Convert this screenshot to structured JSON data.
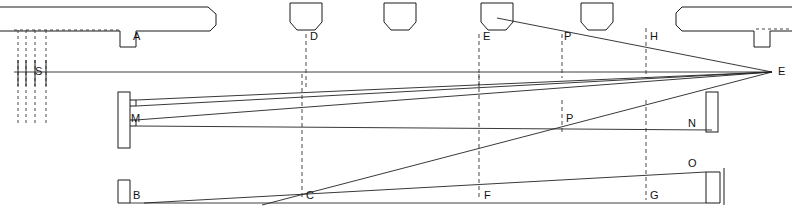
{
  "diagram": {
    "canvas": {
      "width": 792,
      "height": 210
    },
    "colors": {
      "line": "#1a1a1a",
      "ray": "#222222",
      "dashed": "#333333",
      "background": "#ffffff"
    },
    "labels": [
      {
        "key": "A",
        "text": "A",
        "x": 133,
        "y": 31,
        "role": "upper-left-baffle"
      },
      {
        "key": "S",
        "text": "S",
        "x": 35,
        "y": 66,
        "role": "source-slit"
      },
      {
        "key": "D",
        "text": "D",
        "x": 310,
        "y": 31,
        "role": "upper-stop-d"
      },
      {
        "key": "E_top",
        "text": "E",
        "x": 483,
        "y": 31,
        "role": "upper-stop-e"
      },
      {
        "key": "P_top",
        "text": "P",
        "x": 564,
        "y": 31,
        "role": "upper-point-p"
      },
      {
        "key": "H",
        "text": "H",
        "x": 650,
        "y": 31,
        "role": "upper-station-h"
      },
      {
        "key": "E_right",
        "text": "E",
        "x": 778,
        "y": 66,
        "role": "convergence-point-e"
      },
      {
        "key": "M",
        "text": "M",
        "x": 131,
        "y": 118,
        "role": "mirror-slit-m"
      },
      {
        "key": "P_mid",
        "text": "P",
        "x": 566,
        "y": 118,
        "role": "mid-point-p"
      },
      {
        "key": "N",
        "text": "N",
        "x": 690,
        "y": 125,
        "role": "right-stop-n"
      },
      {
        "key": "O",
        "text": "O",
        "x": 690,
        "y": 163,
        "role": "right-corner-o"
      },
      {
        "key": "B",
        "text": "B",
        "x": 133,
        "y": 196,
        "role": "lower-left-baffle"
      },
      {
        "key": "C",
        "text": "C",
        "x": 306,
        "y": 196,
        "role": "lower-station-c"
      },
      {
        "key": "F",
        "text": "F",
        "x": 484,
        "y": 196,
        "role": "lower-station-f"
      },
      {
        "key": "G",
        "text": "G",
        "x": 650,
        "y": 196,
        "role": "lower-station-g"
      }
    ],
    "axis": {
      "name": "optical-axis",
      "from": [
        14,
        72
      ],
      "to": [
        772,
        72
      ]
    },
    "convergence_point": [
      772,
      72
    ],
    "vertical_stations": [
      {
        "name": "station-d",
        "x": 306,
        "y1": 34,
        "y2": 88
      },
      {
        "name": "station-e",
        "x": 479,
        "y1": 34,
        "y2": 90
      },
      {
        "name": "station-p",
        "x": 562,
        "y1": 34,
        "y2": 78
      },
      {
        "name": "station-h",
        "x": 646,
        "y1": 28,
        "y2": 78
      },
      {
        "name": "station-c",
        "x": 302,
        "y1": 74,
        "y2": 200
      },
      {
        "name": "station-f",
        "x": 479,
        "y1": 74,
        "y2": 200
      },
      {
        "name": "station-g",
        "x": 646,
        "y1": 100,
        "y2": 200
      },
      {
        "name": "station-p-mid",
        "x": 562,
        "y1": 100,
        "y2": 130
      }
    ],
    "source_lines": {
      "count": 4,
      "x_positions": [
        18,
        26,
        35,
        46
      ],
      "top": 30,
      "bottom": 126,
      "solid_top": 60,
      "solid_bottom": 86
    },
    "trapezoid_stops": [
      {
        "name": "stop-d",
        "cx": 306,
        "top": 3,
        "bottom": 30,
        "top_half_width": 16,
        "bottom_half_width": 13
      },
      {
        "name": "stop-unlabeled",
        "cx": 400,
        "top": 3,
        "bottom": 30,
        "top_half_width": 16,
        "bottom_half_width": 13
      },
      {
        "name": "stop-e",
        "cx": 497,
        "top": 3,
        "bottom": 30,
        "top_half_width": 16,
        "bottom_half_width": 13
      },
      {
        "name": "stop-p",
        "cx": 597,
        "top": 3,
        "bottom": 30,
        "top_half_width": 16,
        "bottom_half_width": 13
      }
    ],
    "rays": [
      {
        "name": "ray-m-to-e-upper",
        "from": [
          128,
          98
        ],
        "to": [
          772,
          72
        ]
      },
      {
        "name": "ray-m-to-e-mid",
        "from": [
          128,
          106
        ],
        "to": [
          772,
          72
        ]
      },
      {
        "name": "ray-m-to-e-lower",
        "from": [
          128,
          120
        ],
        "to": [
          772,
          72
        ]
      },
      {
        "name": "ray-m-to-n",
        "from": [
          128,
          126
        ],
        "to": [
          712,
          130
        ]
      },
      {
        "name": "ray-top-to-e",
        "from": [
          497,
          20
        ],
        "to": [
          772,
          72
        ]
      },
      {
        "name": "ray-c-to-e",
        "from": [
          262,
          205
        ],
        "to": [
          772,
          72
        ]
      },
      {
        "name": "ray-b-to-o",
        "from": [
          144,
          203
        ],
        "to": [
          706,
          172
        ]
      }
    ],
    "baffles": {
      "upper_left": {
        "name": "baffle-a",
        "label": "A"
      },
      "lower_left": {
        "name": "baffle-b",
        "label": "B"
      },
      "right_upper": {
        "name": "baffle-right-upper"
      },
      "right_n": {
        "name": "baffle-n"
      },
      "right_o": {
        "name": "baffle-o"
      }
    }
  }
}
